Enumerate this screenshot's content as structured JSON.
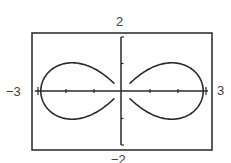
{
  "chart_data": {
    "type": "line",
    "title": "",
    "xlabel": "",
    "ylabel": "",
    "xlim": [
      -3,
      3
    ],
    "ylim": [
      -2,
      2
    ],
    "xticks": [
      -3,
      -2,
      -1,
      0,
      1,
      2,
      3
    ],
    "yticks": [
      -2,
      -1,
      0,
      1,
      2
    ],
    "window_labels": {
      "xmin": "−3",
      "xmax": "3",
      "ymin": "−2",
      "ymax": "2"
    },
    "grid": false,
    "legend": null,
    "series": [
      {
        "name": "lemniscate",
        "description": "figure-eight curve, r^2 = 9 cos(2θ)",
        "x_extent": [
          -2.9,
          2.9
        ],
        "y_extent": [
          -1.03,
          1.03
        ],
        "points": [
          [
            2.9,
            0.0
          ],
          [
            2.84,
            0.38
          ],
          [
            2.66,
            0.68
          ],
          [
            2.4,
            0.9
          ],
          [
            2.1,
            1.0
          ],
          [
            1.78,
            1.03
          ],
          [
            1.45,
            0.98
          ],
          [
            1.12,
            0.86
          ],
          [
            0.8,
            0.67
          ],
          [
            0.45,
            0.4
          ],
          [
            0.0,
            0.0
          ],
          [
            -0.45,
            0.4
          ],
          [
            -0.8,
            0.67
          ],
          [
            -1.12,
            0.86
          ],
          [
            -1.45,
            0.98
          ],
          [
            -1.78,
            1.03
          ],
          [
            -2.1,
            1.0
          ],
          [
            -2.4,
            0.9
          ],
          [
            -2.66,
            0.68
          ],
          [
            -2.84,
            0.38
          ],
          [
            -2.9,
            0.0
          ]
        ]
      }
    ],
    "style": {
      "curve_color": "#2a2a2a",
      "axis_color": "#2a2a2a",
      "frame_color": "#333333",
      "label_color": "#444444",
      "background": "#ffffff"
    }
  }
}
